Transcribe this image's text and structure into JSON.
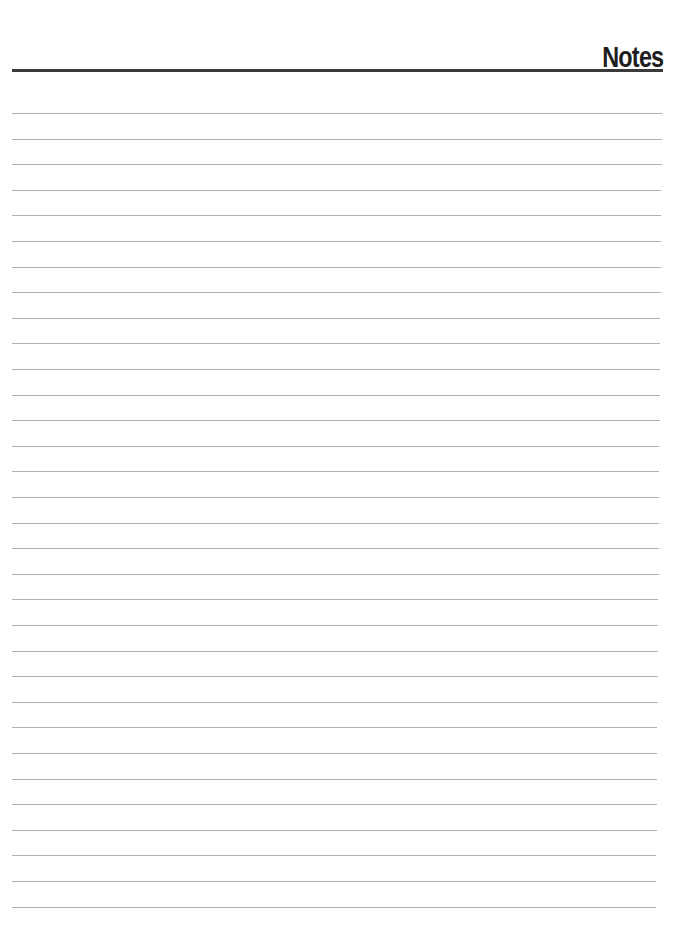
{
  "page": {
    "title": "Notes",
    "rule_count": 32,
    "first_rule_y": 113,
    "rule_spacing": 25.6,
    "colors": {
      "title": "#1e1e1e",
      "header_rule": "#3a3a3a",
      "ruled_line": "#b0b0b0"
    }
  }
}
